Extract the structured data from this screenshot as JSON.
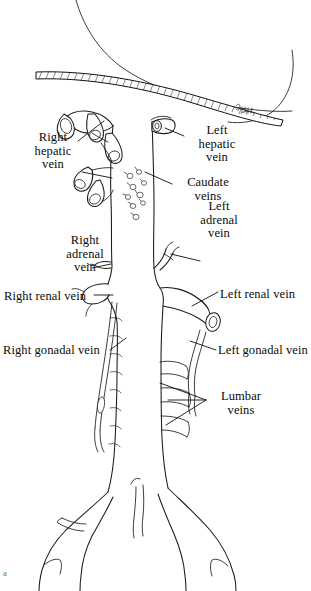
{
  "figure": {
    "panel_letter": "a",
    "background_color": "#ffffff",
    "ink_color": "#1a1a1a",
    "style": "anatomical line drawing"
  },
  "labels": [
    {
      "id": "right-hepatic-vein",
      "lines": [
        "Right",
        "hepatic",
        "vein"
      ],
      "text": "Right hepatic vein",
      "align": "center",
      "x": 24,
      "y": 131,
      "width": 58
    },
    {
      "id": "left-hepatic-vein",
      "lines": [
        "Left",
        "hepatic",
        "vein"
      ],
      "text": "Left hepatic vein",
      "align": "center",
      "x": 186,
      "y": 124,
      "width": 62
    },
    {
      "id": "caudate-veins",
      "lines": [
        "Caudate",
        "veins"
      ],
      "text": "Caudate veins",
      "align": "center",
      "x": 174,
      "y": 176,
      "width": 68
    },
    {
      "id": "right-adrenal-vein",
      "lines": [
        "Right",
        "adrenal",
        "vein"
      ],
      "text": "Right adrenal vein",
      "align": "center",
      "x": 54,
      "y": 234,
      "width": 62
    },
    {
      "id": "left-adrenal-vein",
      "lines": [
        "Left",
        "adrenal",
        "vein"
      ],
      "text": "Left adrenal vein",
      "align": "center",
      "x": 188,
      "y": 200,
      "width": 62
    },
    {
      "id": "right-renal-vein",
      "lines": [
        "Right renal vein"
      ],
      "text": "Right renal vein",
      "align": "left",
      "x": 4,
      "y": 290,
      "width": 92
    },
    {
      "id": "left-renal-vein",
      "lines": [
        "Left renal vein"
      ],
      "text": "Left renal vein",
      "align": "left",
      "x": 220,
      "y": 288,
      "width": 88
    },
    {
      "id": "right-gonadal-vein",
      "lines": [
        "Right gonadal vein"
      ],
      "text": "Right gonadal vein",
      "align": "left",
      "x": 3,
      "y": 344,
      "width": 106
    },
    {
      "id": "left-gonadal-vein",
      "lines": [
        "Left gonadal vein"
      ],
      "text": "Left gonadal vein",
      "align": "left",
      "x": 218,
      "y": 344,
      "width": 100
    },
    {
      "id": "lumbar-veins",
      "lines": [
        "Lumbar",
        "veins"
      ],
      "text": "Lumbar veins",
      "align": "center",
      "x": 208,
      "y": 390,
      "width": 66
    }
  ],
  "structures": [
    {
      "id": "diaphragm",
      "name": "diaphragm-cut-edge",
      "description": "hatched sectioned diaphragm across the top"
    },
    {
      "id": "ivc",
      "name": "inferior-vena-cava",
      "description": "central vertical great vein trunk"
    },
    {
      "id": "hepatic-vein-stumps",
      "name": "hepatic-vein-stumps",
      "count": 5,
      "description": "cut hepatic vein openings at the top of the IVC"
    },
    {
      "id": "caudate-vein-stumps",
      "name": "caudate-vein-stumps",
      "count": 9,
      "description": "small caudate lobe vein openings on the anterior IVC"
    },
    {
      "id": "right-adrenal-vein",
      "name": "right-adrenal-vein-stub",
      "description": "short stub on the right side of the IVC"
    },
    {
      "id": "left-adrenal-vein",
      "name": "left-adrenal-vein-branch",
      "description": "branch rising from the left renal vein"
    },
    {
      "id": "right-renal-vein",
      "name": "right-renal-vein-stump",
      "description": "right renal vein entering the IVC"
    },
    {
      "id": "left-renal-vein",
      "name": "left-renal-vein-stump",
      "description": "left renal vein with open cut end"
    },
    {
      "id": "right-gonadal-vein",
      "name": "right-gonadal-vein",
      "description": "slim vein descending along the right IVC"
    },
    {
      "id": "left-gonadal-vein",
      "name": "left-gonadal-vein",
      "description": "slim vein descending from the left renal vein"
    },
    {
      "id": "lumbar-veins",
      "name": "lumbar-vein-stubs",
      "count": 4,
      "description": "segmental posterior stubs on the left of the IVC"
    },
    {
      "id": "common-iliac-veins",
      "name": "common-iliac-veins",
      "count": 2,
      "description": "IVC bifurcation into right and left common iliac veins"
    }
  ]
}
